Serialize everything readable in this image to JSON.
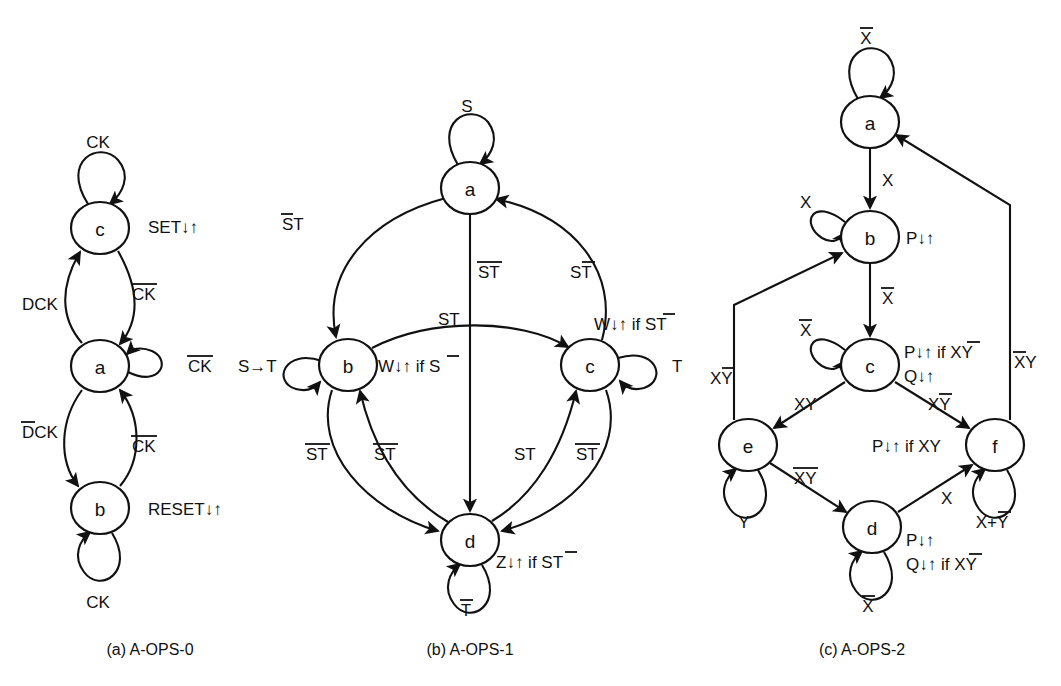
{
  "figure": {
    "background_color": "#ffffff",
    "line_color": "#111111",
    "captions": [
      {
        "id": "caption-a",
        "text": "(a) A-OPS-0",
        "x": 150,
        "y": 650
      },
      {
        "id": "caption-b",
        "text": "(b) A-OPS-1",
        "x": 470,
        "y": 650
      },
      {
        "id": "caption-c",
        "text": "(c) A-OPS-2",
        "x": 862,
        "y": 650
      }
    ]
  },
  "diagram_a": {
    "name": "A-OPS-0",
    "states": [
      {
        "id": "a-c",
        "label": "c",
        "cx": 100,
        "cy": 228,
        "r": 27
      },
      {
        "id": "a-a",
        "label": "a",
        "cx": 100,
        "cy": 366,
        "r": 27
      },
      {
        "id": "a-b",
        "label": "b",
        "cx": 100,
        "cy": 508,
        "r": 27
      }
    ],
    "self_loops": [
      {
        "id": "a-loop-c",
        "state": "c",
        "label": "CK",
        "label_x": 98,
        "label_y": 148,
        "dir": "up"
      },
      {
        "id": "a-loop-a",
        "state": "a",
        "label": "CK",
        "overline": "CK",
        "label_x": 188,
        "label_y": 372,
        "dir": "right"
      },
      {
        "id": "a-loop-b",
        "state": "b",
        "label": "CK",
        "label_x": 98,
        "label_y": 608,
        "dir": "down"
      }
    ],
    "transitions": [
      {
        "id": "a-t-c-a",
        "from": "c",
        "to": "a",
        "label": "CK",
        "overline": "CK",
        "label_x": 132,
        "label_y": 300
      },
      {
        "id": "a-t-a-c",
        "from": "a",
        "to": "c",
        "label": "DCK",
        "label_x": 22,
        "label_y": 310
      },
      {
        "id": "a-t-a-b",
        "from": "a",
        "to": "b",
        "label": "DCK",
        "overline": "D",
        "label_x": 22,
        "label_y": 438
      },
      {
        "id": "a-t-b-a",
        "from": "b",
        "to": "a",
        "label": "CK",
        "overline": "CK",
        "label_x": 132,
        "label_y": 452
      }
    ],
    "outputs": [
      {
        "id": "a-out-c",
        "state": "c",
        "text": "SET↓↑",
        "x": 148,
        "y": 227
      },
      {
        "id": "a-out-b",
        "state": "b",
        "text": "RESET↓↑",
        "x": 148,
        "y": 510
      }
    ]
  },
  "diagram_b": {
    "name": "A-OPS-1",
    "states": [
      {
        "id": "b-a",
        "label": "a",
        "cx": 470,
        "cy": 188,
        "r": 27
      },
      {
        "id": "b-b",
        "label": "b",
        "cx": 348,
        "cy": 365,
        "r": 27
      },
      {
        "id": "b-c",
        "label": "c",
        "cx": 590,
        "cy": 365,
        "r": 27
      },
      {
        "id": "b-d",
        "label": "d",
        "cx": 470,
        "cy": 540,
        "r": 27
      }
    ],
    "self_loops": [
      {
        "id": "b-loop-a",
        "state": "a",
        "label": "S",
        "label_x": 467,
        "label_y": 108,
        "dir": "up"
      },
      {
        "id": "b-loop-b",
        "state": "b",
        "label": "S→T",
        "label_x": 238,
        "label_y": 372,
        "dir": "left"
      },
      {
        "id": "b-loop-c",
        "state": "c",
        "label": "T",
        "label_x": 672,
        "label_y": 372,
        "dir": "right"
      },
      {
        "id": "b-loop-d",
        "state": "d",
        "label": "T",
        "overline": "T",
        "label_x": 466,
        "label_y": 612,
        "dir": "down"
      }
    ],
    "transitions": [
      {
        "id": "b-t-a-b",
        "from": "a",
        "to": "b",
        "label": "ST",
        "overline": "S",
        "label_x": 282,
        "label_y": 230
      },
      {
        "id": "b-t-a-d",
        "from": "a",
        "to": "d",
        "label": "ST",
        "overline": "ST",
        "label_x": 478,
        "label_y": 278
      },
      {
        "id": "b-t-c-a",
        "from": "c",
        "to": "a",
        "label": "ST",
        "overline": "T",
        "label_x": 570,
        "label_y": 278
      },
      {
        "id": "b-t-b-c",
        "from": "b",
        "to": "c",
        "label": "ST",
        "label_x": 438,
        "label_y": 325
      },
      {
        "id": "b-t-b-d",
        "from": "b",
        "to": "d",
        "label": "ST",
        "overline": "ST",
        "label_x": 316,
        "label_y": 455
      },
      {
        "id": "b-t-d-b",
        "from": "d",
        "to": "b",
        "label": "ST",
        "overline": "ST",
        "label_x": 378,
        "label_y": 455
      },
      {
        "id": "b-t-d-c",
        "from": "d",
        "to": "c",
        "label": "ST",
        "label_x": 516,
        "label_y": 455
      },
      {
        "id": "b-t-c-d",
        "from": "c",
        "to": "d",
        "label": "ST",
        "overline": "ST",
        "label_x": 580,
        "label_y": 455
      }
    ],
    "outputs": [
      {
        "id": "b-out-b",
        "state": "b",
        "text": "W↓↑ if S",
        "overline": "S",
        "x": 378,
        "y": 372
      },
      {
        "id": "b-out-c",
        "state": "c",
        "text": "W↓↑ if ST",
        "overline": "S",
        "x": 594,
        "y": 324
      },
      {
        "id": "b-out-d",
        "state": "d",
        "text": "Z↓↑ if ST",
        "overline": "T",
        "x": 496,
        "y": 562
      }
    ]
  },
  "diagram_c": {
    "name": "A-OPS-2",
    "states": [
      {
        "id": "c-a",
        "label": "a",
        "cx": 870,
        "cy": 122,
        "r": 27
      },
      {
        "id": "c-b",
        "label": "b",
        "cx": 870,
        "cy": 237,
        "r": 27
      },
      {
        "id": "c-c",
        "label": "c",
        "cx": 870,
        "cy": 365,
        "r": 27
      },
      {
        "id": "c-e",
        "label": "e",
        "cx": 748,
        "cy": 445,
        "r": 27
      },
      {
        "id": "c-f",
        "label": "f",
        "cx": 995,
        "cy": 445,
        "r": 27
      },
      {
        "id": "c-d",
        "label": "d",
        "cx": 872,
        "cy": 527,
        "r": 27
      }
    ],
    "self_loops": [
      {
        "id": "c-loop-a",
        "state": "a",
        "label": "X",
        "overline": "X",
        "label_x": 866,
        "label_y": 40,
        "dir": "up"
      },
      {
        "id": "c-loop-b",
        "state": "b",
        "label": "X",
        "label_x": 806,
        "label_y": 202,
        "dir": "upleft"
      },
      {
        "id": "c-loop-c",
        "state": "c",
        "label": "X",
        "overline": "X",
        "label_x": 806,
        "label_y": 330,
        "dir": "upleft"
      },
      {
        "id": "c-loop-e",
        "state": "e",
        "label": "Y",
        "label_x": 744,
        "label_y": 520,
        "dir": "down"
      },
      {
        "id": "c-loop-d",
        "state": "d",
        "label": "X",
        "overline": "X",
        "label_x": 868,
        "label_y": 605,
        "dir": "down"
      },
      {
        "id": "c-loop-f",
        "state": "f",
        "label": "X+Y",
        "overline": "Y",
        "label_x": 992,
        "label_y": 520,
        "dir": "down"
      }
    ],
    "transitions": [
      {
        "id": "c-t-a-b",
        "from": "a",
        "to": "b",
        "label": "X",
        "label_x": 884,
        "label_y": 180
      },
      {
        "id": "c-t-b-c",
        "from": "b",
        "to": "c",
        "label": "X",
        "overline": "X",
        "label_x": 884,
        "label_y": 298
      },
      {
        "id": "c-t-c-e",
        "from": "c",
        "to": "e",
        "label": "XY",
        "label_x": 800,
        "label_y": 404
      },
      {
        "id": "c-t-c-f",
        "from": "c",
        "to": "f",
        "label": "XY",
        "overline": "Y",
        "label_x": 932,
        "label_y": 404
      },
      {
        "id": "c-t-e-d",
        "from": "e",
        "to": "d",
        "label": "XY",
        "overline": "XY",
        "label_x": 800,
        "label_y": 478
      },
      {
        "id": "c-t-d-f",
        "from": "d",
        "to": "f",
        "label": "X",
        "label_x": 944,
        "label_y": 498
      },
      {
        "id": "c-t-e-b",
        "from": "e",
        "to": "b",
        "label": "XY",
        "overline": "Y",
        "label_x": 718,
        "label_y": 378
      },
      {
        "id": "c-t-f-a",
        "from": "f",
        "to": "a",
        "label": "XY",
        "overline": "X",
        "label_x": 1016,
        "label_y": 362
      }
    ],
    "outputs": [
      {
        "id": "c-out-b",
        "state": "b",
        "text": "P↓↑",
        "x": 908,
        "y": 240
      },
      {
        "id": "c-out-c1",
        "state": "c",
        "text": "P↓↑ if XY",
        "overline": "X",
        "x": 906,
        "y": 352
      },
      {
        "id": "c-out-c2",
        "state": "c",
        "text": "Q↓↑",
        "x": 906,
        "y": 376
      },
      {
        "id": "c-out-f",
        "state": "f",
        "text": "P↓↑ if XY",
        "x": 876,
        "y": 446
      },
      {
        "id": "c-out-d1",
        "state": "d",
        "text": "P↓↑",
        "x": 908,
        "y": 540
      },
      {
        "id": "c-out-d2",
        "state": "d",
        "text": "Q↓↑ if XY",
        "overline": "X",
        "x": 908,
        "y": 564
      }
    ]
  }
}
